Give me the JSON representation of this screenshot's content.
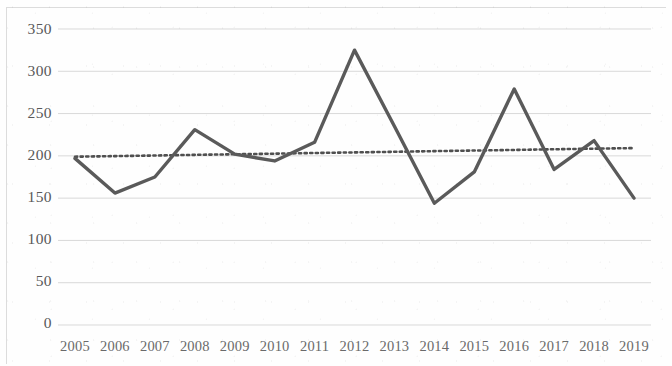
{
  "chart_data": {
    "type": "line",
    "title": "",
    "subtitle": "",
    "xlabel": "",
    "ylabel": "",
    "x": [
      2005,
      2006,
      2007,
      2008,
      2009,
      2010,
      2011,
      2012,
      2013,
      2014,
      2015,
      2016,
      2017,
      2018,
      2019
    ],
    "categories": [
      "2005",
      "2006",
      "2007",
      "2008",
      "2009",
      "2010",
      "2011",
      "2012",
      "2013",
      "2014",
      "2015",
      "2016",
      "2017",
      "2018",
      "2019"
    ],
    "series": [
      {
        "name": "value",
        "style": "solid",
        "color": "#5a5a5a",
        "values": [
          197,
          156,
          175,
          231,
          202,
          194,
          216,
          325,
          235,
          144,
          181,
          279,
          184,
          218,
          150
        ]
      },
      {
        "name": "trendline",
        "style": "dotted",
        "color": "#4f4f4f",
        "values": [
          199,
          199.7,
          200.4,
          201.2,
          201.9,
          202.6,
          203.4,
          204.1,
          204.8,
          205.6,
          206.3,
          207.0,
          207.8,
          208.5,
          209.2
        ]
      }
    ],
    "ylim": [
      0,
      350
    ],
    "ytick_labels": [
      "350",
      "300",
      "250",
      "200",
      "150",
      "100",
      "50",
      "0"
    ],
    "ytick_values": [
      350,
      300,
      250,
      200,
      150,
      100,
      50,
      0
    ],
    "grid": "horizontal",
    "grid_color": "#d9d9d9",
    "legend": "none",
    "legend_position": "none",
    "annotations": []
  },
  "axes": {
    "y_axis_name": "y-axis",
    "x_axis_name": "x-axis"
  }
}
